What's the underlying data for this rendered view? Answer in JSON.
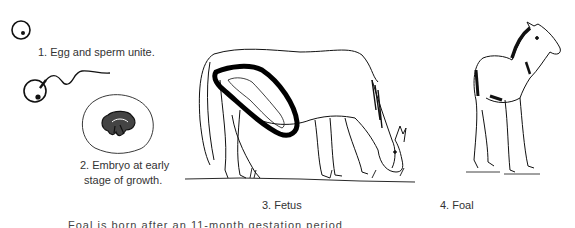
{
  "diagram": {
    "stages": [
      {
        "number": 1,
        "label": "1. Egg and sperm unite."
      },
      {
        "number": 2,
        "label_line1": "2. Embryo at early",
        "label_line2": "stage of growth."
      },
      {
        "number": 3,
        "label": "3. Fetus"
      },
      {
        "number": 4,
        "label": "4. Foal"
      }
    ],
    "footer_text_cut_off": "Foal is born after an 11-month gestation period"
  }
}
